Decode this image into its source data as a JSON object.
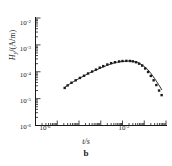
{
  "chart_data": {
    "type": "line",
    "title": "",
    "panel_label": "b",
    "xlabel": "t/s",
    "ylabel": "Hy/(A/m)",
    "ylabel_parts": {
      "symbol": "H",
      "subscript": "y",
      "unit": "/(A/m)"
    },
    "xscale": "log",
    "yscale": "log",
    "xlim": [
      1e-07,
      0.1
    ],
    "ylim": [
      1e-06,
      0.01
    ],
    "grid": false,
    "legend": null,
    "xticks": [
      1e-07,
      1e-06,
      1e-05,
      0.0001,
      0.001,
      0.01,
      0.1
    ],
    "xtick_labels": [
      "",
      "10⁻⁶",
      "",
      "",
      "",
      "10⁻²",
      ""
    ],
    "xtick_labeled": [
      {
        "value": 1e-06,
        "mantissa": "10",
        "exponent": "-6"
      },
      {
        "value": 0.01,
        "mantissa": "10",
        "exponent": "-2"
      }
    ],
    "yticks": [
      1e-06,
      1e-05,
      0.0001,
      0.001,
      0.01
    ],
    "ytick_labeled": [
      {
        "value": 0.01,
        "mantissa": "10",
        "exponent": "-2"
      },
      {
        "value": 0.001,
        "mantissa": "10",
        "exponent": "-3"
      },
      {
        "value": 0.0001,
        "mantissa": "10",
        "exponent": "-4"
      },
      {
        "value": 1e-05,
        "mantissa": "10",
        "exponent": "-5"
      },
      {
        "value": 1e-06,
        "mantissa": "10",
        "exponent": "-6"
      }
    ],
    "minor_ticks": true,
    "series": [
      {
        "name": "model curve",
        "style": "line",
        "color": "#1a1a1a",
        "x": [
          2.2e-06,
          3.5e-06,
          6e-06,
          1e-05,
          1.8e-05,
          3e-05,
          5.5e-05,
          0.0001,
          0.00018,
          0.0003,
          0.00055,
          0.001,
          0.0018,
          0.003,
          0.005,
          0.008,
          0.013,
          0.02,
          0.03,
          0.045,
          0.065
        ],
        "y": [
          2.6e-05,
          3.4e-05,
          4.4e-05,
          5.6e-05,
          7.2e-05,
          9e-05,
          0.000112,
          0.000138,
          0.000168,
          0.000198,
          0.000225,
          0.000242,
          0.00025,
          0.000244,
          0.00022,
          0.00018,
          0.000132,
          8.8e-05,
          5.6e-05,
          3.4e-05,
          2.1e-05
        ]
      },
      {
        "name": "measured data",
        "style": "markers",
        "marker": "square",
        "color": "#1a1a1a",
        "x": [
          2.2e-06,
          3e-06,
          4.5e-06,
          7e-06,
          1.1e-05,
          1.7e-05,
          2.6e-05,
          4e-05,
          6e-05,
          9e-05,
          0.00013,
          0.0002,
          0.0003,
          0.00045,
          0.0007,
          0.001,
          0.0015,
          0.0022,
          0.003,
          0.0042,
          0.0058,
          0.008,
          0.011,
          0.015,
          0.02,
          0.027,
          0.036,
          0.048,
          0.063
        ],
        "y": [
          2.5e-05,
          3.1e-05,
          3.9e-05,
          4.8e-05,
          5.9e-05,
          7.1e-05,
          8.6e-05,
          0.000102,
          0.00012,
          0.000142,
          0.000162,
          0.000186,
          0.000208,
          0.000226,
          0.000242,
          0.00025,
          0.000254,
          0.000252,
          0.000244,
          0.000226,
          0.0002,
          0.00017,
          0.000132,
          9.8e-05,
          7e-05,
          4.8e-05,
          3.2e-05,
          2e-05,
          1.35e-05
        ]
      }
    ]
  }
}
